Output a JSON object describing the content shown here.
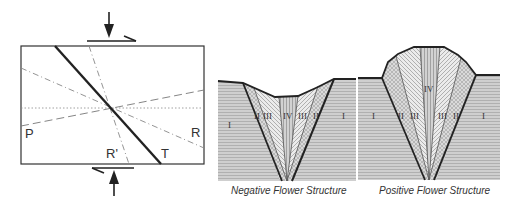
{
  "shear_diagram": {
    "labels": {
      "p": "P",
      "r": "R",
      "r_prime": "R'",
      "t": "T"
    }
  },
  "negative_flower": {
    "caption": "Negative Flower Structure",
    "zones": {
      "left_i": "I",
      "left_ii": "II",
      "left_iii": "III",
      "center_iv": "IV",
      "right_iii": "III",
      "right_ii": "II",
      "right_i": "I"
    }
  },
  "positive_flower": {
    "caption": "Positive Flower Structure",
    "zones": {
      "left_i": "I",
      "left_ii": "II",
      "left_iii": "III",
      "center_iv": "IV",
      "right_iii": "III",
      "right_ii": "II",
      "right_i": "I"
    }
  },
  "colors": {
    "line": "#2a2a2a",
    "dash": "#7a7a7a",
    "zone_i": "#c9c9c9",
    "zone_ii": "#d6d6d6",
    "zone_iii": "#e6e6e6",
    "zone_iv": "#c4c4c4"
  }
}
